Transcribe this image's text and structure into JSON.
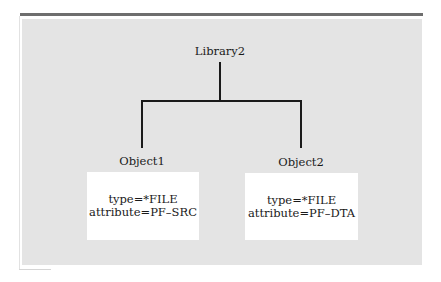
{
  "diagram": {
    "root": {
      "label": "Library2"
    },
    "children": [
      {
        "label": "Object1",
        "type_line": "type=*FILE",
        "attribute_line": "attribute=PF–SRC"
      },
      {
        "label": "Object2",
        "type_line": "type=*FILE",
        "attribute_line": "attribute=PF–DTA"
      }
    ],
    "colors": {
      "panel": "#e4e4e4",
      "top_bar": "#6e6e6e",
      "lines": "#1a1a1a",
      "box": "#ffffff"
    }
  }
}
